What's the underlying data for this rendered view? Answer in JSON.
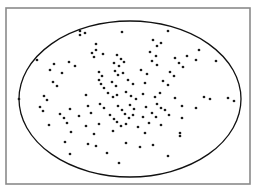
{
  "figure": {
    "width": 257,
    "height": 193,
    "background_color": "#ffffff",
    "caption": "",
    "frame": {
      "x": 6,
      "y": 8,
      "width": 244,
      "height": 176,
      "stroke_color": "#8a8a8a",
      "stroke_width": 1.6,
      "fill": "none"
    }
  },
  "chart_data": {
    "type": "scatter",
    "title": "",
    "subtitle": "",
    "xlabel": "",
    "ylabel": "",
    "grid": false,
    "legend": null,
    "axis_ticks": [],
    "tick_labels": [],
    "xlim": [
      6,
      250
    ],
    "ylim": [
      8,
      184
    ],
    "marker": {
      "shape": "circle",
      "color": "#1a1a1a",
      "radius": 1.35
    },
    "annotations": [
      {
        "kind": "ellipse",
        "name": "boundary-ellipse",
        "cx": 130,
        "cy": 99,
        "rx": 111,
        "ry": 78,
        "stroke_color": "#111111",
        "stroke_width": 1.3,
        "fill": "none"
      }
    ],
    "n_points": 123,
    "points": [
      [
        80,
        31
      ],
      [
        80,
        35
      ],
      [
        85,
        33
      ],
      [
        122,
        32
      ],
      [
        168,
        31
      ],
      [
        96,
        44
      ],
      [
        153,
        40
      ],
      [
        157,
        46
      ],
      [
        161,
        43
      ],
      [
        103,
        54
      ],
      [
        150,
        52
      ],
      [
        156,
        56
      ],
      [
        92,
        53
      ],
      [
        94,
        57
      ],
      [
        96,
        50
      ],
      [
        199,
        50
      ],
      [
        37,
        60
      ],
      [
        54,
        64
      ],
      [
        117,
        55
      ],
      [
        121,
        59
      ],
      [
        175,
        58
      ],
      [
        187,
        56
      ],
      [
        196,
        60
      ],
      [
        69,
        62
      ],
      [
        75,
        66
      ],
      [
        114,
        63
      ],
      [
        119,
        66
      ],
      [
        124,
        62
      ],
      [
        152,
        61
      ],
      [
        157,
        65
      ],
      [
        179,
        63
      ],
      [
        183,
        67
      ],
      [
        216,
        61
      ],
      [
        50,
        70
      ],
      [
        62,
        73
      ],
      [
        99,
        72
      ],
      [
        102,
        76
      ],
      [
        115,
        71
      ],
      [
        118,
        75
      ],
      [
        123,
        73
      ],
      [
        141,
        70
      ],
      [
        147,
        74
      ],
      [
        170,
        72
      ],
      [
        174,
        76
      ],
      [
        53,
        82
      ],
      [
        57,
        86
      ],
      [
        99,
        80
      ],
      [
        101,
        84
      ],
      [
        104,
        88
      ],
      [
        112,
        82
      ],
      [
        116,
        86
      ],
      [
        128,
        80
      ],
      [
        133,
        84
      ],
      [
        145,
        83
      ],
      [
        163,
        81
      ],
      [
        168,
        85
      ],
      [
        19,
        99
      ],
      [
        44,
        96
      ],
      [
        47,
        100
      ],
      [
        86,
        95
      ],
      [
        108,
        93
      ],
      [
        113,
        97
      ],
      [
        117,
        95
      ],
      [
        126,
        92
      ],
      [
        131,
        96
      ],
      [
        136,
        99
      ],
      [
        143,
        94
      ],
      [
        155,
        97
      ],
      [
        160,
        93
      ],
      [
        175,
        98
      ],
      [
        204,
        97
      ],
      [
        210,
        99
      ],
      [
        228,
        98
      ],
      [
        234,
        101
      ],
      [
        40,
        107
      ],
      [
        43,
        111
      ],
      [
        70,
        109
      ],
      [
        88,
        106
      ],
      [
        100,
        104
      ],
      [
        104,
        108
      ],
      [
        118,
        106
      ],
      [
        122,
        110
      ],
      [
        130,
        105
      ],
      [
        134,
        109
      ],
      [
        146,
        107
      ],
      [
        157,
        104
      ],
      [
        161,
        108
      ],
      [
        165,
        110
      ],
      [
        182,
        106
      ],
      [
        196,
        108
      ],
      [
        60,
        114
      ],
      [
        64,
        118
      ],
      [
        79,
        116
      ],
      [
        91,
        113
      ],
      [
        110,
        115
      ],
      [
        114,
        119
      ],
      [
        125,
        114
      ],
      [
        129,
        118
      ],
      [
        133,
        115
      ],
      [
        143,
        117
      ],
      [
        152,
        113
      ],
      [
        156,
        117
      ],
      [
        169,
        115
      ],
      [
        182,
        118
      ],
      [
        49,
        125
      ],
      [
        67,
        123
      ],
      [
        86,
        126
      ],
      [
        99,
        124
      ],
      [
        117,
        122
      ],
      [
        121,
        126
      ],
      [
        126,
        124
      ],
      [
        138,
        127
      ],
      [
        149,
        123
      ],
      [
        161,
        125
      ],
      [
        71,
        132
      ],
      [
        94,
        134
      ],
      [
        113,
        131
      ],
      [
        145,
        133
      ],
      [
        180,
        133
      ],
      [
        180,
        136
      ],
      [
        65,
        142
      ],
      [
        88,
        144
      ],
      [
        96,
        146
      ],
      [
        126,
        143
      ],
      [
        140,
        147
      ],
      [
        153,
        145
      ],
      [
        70,
        154
      ],
      [
        107,
        153
      ],
      [
        168,
        156
      ],
      [
        119,
        163
      ]
    ]
  }
}
